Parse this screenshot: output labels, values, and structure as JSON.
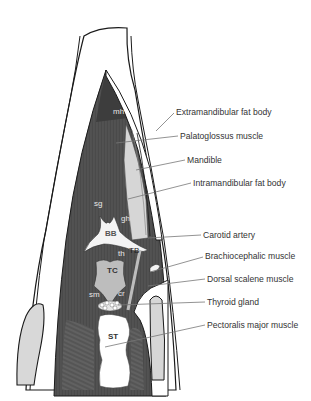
{
  "diagram": {
    "type": "anatomical-illustration",
    "labels": [
      {
        "id": "extramandibular-fat-body",
        "text": "Extramandibular fat body",
        "x": 176,
        "y": 115,
        "target": [
          156,
          131
        ]
      },
      {
        "id": "palatoglossus-muscle",
        "text": "Palatoglossus muscle",
        "x": 180,
        "y": 139,
        "target": [
          116,
          143
        ]
      },
      {
        "id": "mandible",
        "text": "Mandible",
        "x": 187,
        "y": 163,
        "target": [
          136,
          170
        ]
      },
      {
        "id": "intramandibular-fat-body",
        "text": "Intramandibular fat body",
        "x": 193,
        "y": 186,
        "target": [
          128,
          199
        ]
      },
      {
        "id": "carotid-artery",
        "text": "Carotid artery",
        "x": 203,
        "y": 238,
        "target": [
          148,
          238
        ]
      },
      {
        "id": "brachiocephalic-muscle",
        "text": "Brachiocephalic muscle",
        "x": 205,
        "y": 259,
        "target": [
          150,
          272
        ]
      },
      {
        "id": "dorsal-scalene-muscle",
        "text": "Dorsal scalene muscle",
        "x": 207,
        "y": 282,
        "target": [
          148,
          286
        ]
      },
      {
        "id": "thyroid-gland",
        "text": "Thyroid gland",
        "x": 207,
        "y": 305,
        "target": [
          118,
          305
        ]
      },
      {
        "id": "pectoralis-major-muscle",
        "text": "Pectoralis major muscle",
        "x": 207,
        "y": 328,
        "target": [
          105,
          347
        ]
      }
    ],
    "abbreviations": [
      {
        "text": "mh",
        "x": 113,
        "y": 114
      },
      {
        "text": "sg",
        "x": 94,
        "y": 206
      },
      {
        "text": "gh",
        "x": 121,
        "y": 221
      },
      {
        "text": "BB",
        "x": 105,
        "y": 236
      },
      {
        "text": "TB",
        "x": 129,
        "y": 253
      },
      {
        "text": "th",
        "x": 118,
        "y": 256
      },
      {
        "text": "TC",
        "x": 107,
        "y": 273
      },
      {
        "text": "sm",
        "x": 89,
        "y": 297
      },
      {
        "text": "cr",
        "x": 118,
        "y": 296
      },
      {
        "text": "ST",
        "x": 108,
        "y": 339
      }
    ],
    "colors": {
      "outline": "#1a1a1a",
      "skin": "#ffffff",
      "muscle_dark": "#4a4a4a",
      "muscle_mid": "#6a6a6a",
      "fat_light": "#d6d6d6",
      "bone": "#f4f4f4",
      "cartilage": "#bdbdbd",
      "label_text": "#333333",
      "leader_line": "#777777"
    }
  }
}
